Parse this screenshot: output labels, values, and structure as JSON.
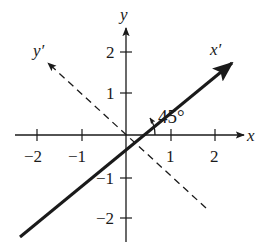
{
  "figure": {
    "axes": {
      "x_label": "x",
      "y_label": "y",
      "x_prime_label": "x′",
      "y_prime_label": "y′"
    },
    "x_ticks": [
      {
        "value": -2,
        "label": "−2"
      },
      {
        "value": -1,
        "label": "−1"
      },
      {
        "value": 1,
        "label": "1"
      },
      {
        "value": 2,
        "label": "2"
      }
    ],
    "y_ticks": [
      {
        "value": 2,
        "label": "2"
      },
      {
        "value": 1,
        "label": "1"
      },
      {
        "value": -1,
        "label": "−1"
      },
      {
        "value": -2,
        "label": "−2"
      }
    ],
    "angle_label": "45°",
    "rotated_x_axis_style": "solid-thick",
    "rotated_y_axis_style": "dashed",
    "colors": {
      "ink": "#1a1a1a",
      "background": "#ffffff"
    }
  }
}
